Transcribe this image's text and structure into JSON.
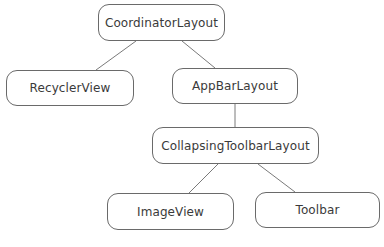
{
  "diagram": {
    "type": "tree",
    "title": "",
    "nodes": [
      {
        "id": "coordinator",
        "label": "CoordinatorLayout"
      },
      {
        "id": "recycler",
        "label": "RecyclerView"
      },
      {
        "id": "appbar",
        "label": "AppBarLayout"
      },
      {
        "id": "collapsing",
        "label": "CollapsingToolbarLayout"
      },
      {
        "id": "imageview",
        "label": "ImageView"
      },
      {
        "id": "toolbar",
        "label": "Toolbar"
      }
    ],
    "edges": [
      {
        "from": "coordinator",
        "to": "recycler"
      },
      {
        "from": "coordinator",
        "to": "appbar"
      },
      {
        "from": "appbar",
        "to": "collapsing"
      },
      {
        "from": "collapsing",
        "to": "imageview"
      },
      {
        "from": "collapsing",
        "to": "toolbar"
      }
    ],
    "colors": {
      "stroke": "#6a6a6a",
      "text": "#3a3a3a",
      "background": "#ffffff"
    }
  }
}
